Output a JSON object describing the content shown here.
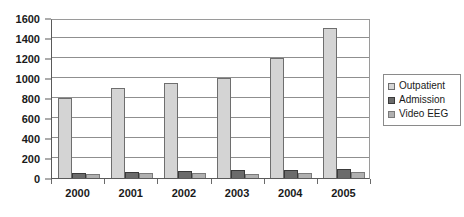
{
  "chart_data": {
    "type": "bar",
    "title": "",
    "subtitle": "",
    "xlabel": "",
    "ylabel": "",
    "categories": [
      "2000",
      "2001",
      "2002",
      "2003",
      "2004",
      "2005"
    ],
    "series": [
      {
        "name": "Outpatient",
        "color": "#d4d4d4",
        "values": [
          800,
          900,
          950,
          1000,
          1200,
          1500
        ]
      },
      {
        "name": "Admission",
        "color": "#6b6b6b",
        "values": [
          55,
          65,
          70,
          80,
          80,
          90
        ]
      },
      {
        "name": "Video EEG",
        "color": "#b0b0b0",
        "values": [
          40,
          50,
          50,
          45,
          55,
          60
        ]
      }
    ],
    "ylim": [
      0,
      1600
    ],
    "ytick_step": 200,
    "yticks": [
      0,
      200,
      400,
      600,
      800,
      1000,
      1200,
      1400,
      1600
    ],
    "ytick_labels": [
      "0",
      "200",
      "400",
      "600",
      "800",
      "1000",
      "1200",
      "1400",
      "1600"
    ],
    "grid": "horizontal",
    "legend_position": "right",
    "legend_entries": [
      "Outpatient",
      "Admission",
      "Video EEG"
    ]
  }
}
